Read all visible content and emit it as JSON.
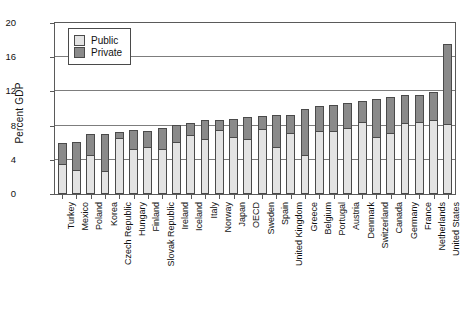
{
  "chart_data": {
    "type": "bar",
    "title": "",
    "subtitle": "",
    "xlabel": "",
    "ylabel": "Percent GDP",
    "ylim": [
      0,
      20
    ],
    "yticks": [
      0,
      4,
      8,
      12,
      16,
      20
    ],
    "grid": true,
    "stacked": true,
    "legend_position": "top-left",
    "categories": [
      "Turkey",
      "Mexico",
      "Poland",
      "Korea",
      "Czech Republic",
      "Hungary",
      "Finland",
      "Slovak Republic",
      "Ireland",
      "Iceland",
      "Italy",
      "Norway",
      "Japan",
      "OECD",
      "Sweden",
      "Spain",
      "United Kingdom",
      "Greece",
      "Belgium",
      "Portugal",
      "Austria",
      "Denmark",
      "Switzerland",
      "Canada",
      "Germany",
      "France",
      "Netherlands",
      "United States"
    ],
    "series": [
      {
        "name": "Public",
        "color": "#e3e3e3",
        "values": [
          3.4,
          2.7,
          4.5,
          2.6,
          6.4,
          5.2,
          5.4,
          5.2,
          6.0,
          6.8,
          6.3,
          7.4,
          6.5,
          6.3,
          7.5,
          5.4,
          7.0,
          4.5,
          7.3,
          7.2,
          7.6,
          8.3,
          6.5,
          7.0,
          8.2,
          8.3,
          8.5,
          8.1
        ]
      },
      {
        "name": "Private",
        "color": "#8a8a8a",
        "values": [
          2.6,
          3.4,
          2.5,
          4.4,
          0.8,
          2.3,
          2.0,
          2.5,
          2.1,
          1.5,
          2.3,
          1.3,
          2.3,
          2.7,
          1.6,
          3.8,
          2.3,
          5.5,
          3.0,
          3.2,
          3.1,
          2.6,
          4.6,
          4.3,
          3.4,
          3.3,
          3.4,
          9.5
        ]
      }
    ],
    "totals": [
      6.0,
      6.1,
      7.0,
      7.0,
      7.2,
      7.5,
      7.4,
      7.7,
      8.1,
      8.3,
      8.6,
      8.7,
      8.8,
      9.0,
      9.1,
      9.2,
      9.3,
      10.0,
      10.3,
      10.4,
      10.7,
      10.9,
      11.1,
      11.3,
      11.6,
      11.6,
      11.9,
      17.6
    ]
  },
  "legend": {
    "items": [
      {
        "label": "Public",
        "color": "#e3e3e3"
      },
      {
        "label": "Private",
        "color": "#8a8a8a"
      }
    ]
  },
  "axes": {
    "y_title": "Percent GDP",
    "y_ticks": [
      "0",
      "4",
      "8",
      "12",
      "16",
      "20"
    ]
  }
}
